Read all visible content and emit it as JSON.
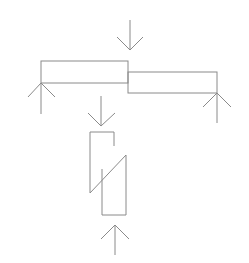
{
  "diagram": {
    "stroke_color": "#8a8a8a",
    "background": "#ffffff",
    "beam_left": {
      "x": 41,
      "y": 61,
      "w": 87,
      "h": 22
    },
    "beam_right": {
      "x": 128,
      "y": 72,
      "w": 89,
      "h": 21
    },
    "lap_joint": {
      "upper": {
        "x1": 90,
        "x2": 114,
        "top": 132,
        "bottom_left": 193,
        "diag_right_y": 155
      },
      "lower": {
        "x1": 102,
        "x2": 126,
        "bottom": 215
      }
    },
    "arrows": [
      {
        "name": "load-down-top",
        "x": 130,
        "tail_y": 20,
        "tip_y": 50,
        "direction": "down"
      },
      {
        "name": "support-up-left",
        "x": 41,
        "tail_y": 114,
        "tip_y": 83,
        "direction": "up"
      },
      {
        "name": "support-up-right",
        "x": 217,
        "tail_y": 123,
        "tip_y": 93,
        "direction": "up"
      },
      {
        "name": "load-down-middle",
        "x": 101,
        "tail_y": 96,
        "tip_y": 126,
        "direction": "down"
      },
      {
        "name": "support-up-bottom",
        "x": 115,
        "tail_y": 255,
        "tip_y": 225,
        "direction": "up"
      }
    ]
  }
}
